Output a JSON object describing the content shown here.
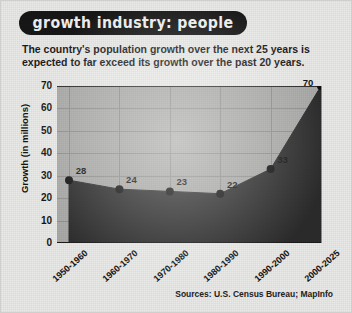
{
  "banner": {
    "title": "growth industry: people"
  },
  "subtitle": {
    "line1": "The country's population growth over the next 25 years is",
    "line2": "expected to far exceed its growth over the past 20 years."
  },
  "source": {
    "text": "Sources: U.S. Census Bureau; MapInfo"
  },
  "colors": {
    "page_background": "#e9e9e7",
    "plot_background": "#a9a9a7",
    "area_fill": "#2b2b2b",
    "banner_background": "#171717",
    "banner_text": "#f2f2f2",
    "gridline": "#8e8e8c",
    "marker": "#101010"
  },
  "chart_data": {
    "type": "area",
    "title": "growth industry: people",
    "xlabel": "",
    "ylabel": "Growth (in millions)",
    "categories": [
      "1950-1960",
      "1960-1970",
      "1970-1980",
      "1980-1990",
      "1990-2000",
      "2000-2025"
    ],
    "values": [
      28,
      24,
      23,
      22,
      33,
      70
    ],
    "data_labels": [
      "28",
      "24",
      "23",
      "22",
      "33",
      "70"
    ],
    "ylim": [
      0,
      70
    ],
    "yticks": [
      0,
      10,
      20,
      30,
      40,
      50,
      60,
      70
    ],
    "ytick_labels": [
      "0",
      "10",
      "20",
      "30",
      "40",
      "50",
      "60",
      "70"
    ],
    "grid": true,
    "legend": false,
    "markers": true
  }
}
